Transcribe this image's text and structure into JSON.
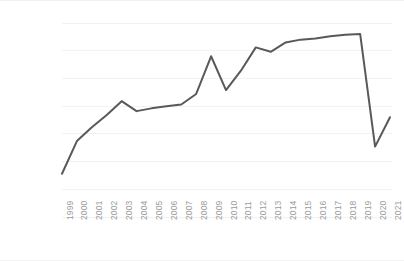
{
  "chart_data": {
    "type": "line",
    "title": "",
    "subtitle": "",
    "xlabel": "",
    "ylabel": "",
    "categories": [
      "1999",
      "2000",
      "2001",
      "2002",
      "2003",
      "2004",
      "2005",
      "2006",
      "2007",
      "2008",
      "2009",
      "2010",
      "2011",
      "2012",
      "2013",
      "2014",
      "2015",
      "2016",
      "2017",
      "2018",
      "2019",
      "2020",
      "2021"
    ],
    "values": [
      780000,
      1370000,
      1620000,
      1840000,
      2090000,
      1910000,
      1960000,
      2000000,
      2030000,
      2220000,
      2900000,
      2290000,
      2640000,
      3060000,
      2980000,
      3150000,
      3200000,
      3220000,
      3260000,
      3290000,
      3300000,
      1270000,
      1800000
    ],
    "series": [
      {
        "name": "series-1",
        "values": [
          780000,
          1370000,
          1620000,
          1840000,
          2090000,
          1910000,
          1960000,
          2000000,
          2030000,
          2220000,
          2900000,
          2290000,
          2640000,
          3060000,
          2980000,
          3150000,
          3200000,
          3220000,
          3260000,
          3290000,
          3300000,
          1270000,
          1800000
        ],
        "color": "#595959"
      }
    ],
    "ylim": [
      0,
      3500000
    ],
    "yticks": [
      0,
      500000,
      1000000,
      1500000,
      2000000,
      2500000,
      3000000,
      3500000
    ],
    "ytick_labels": [
      "0",
      "500,000",
      "1,000,000",
      "1,500,000",
      "2,000,000",
      "2,500,000",
      "3,000,000",
      "3,500,000"
    ],
    "xtick_labels": [
      "1999",
      "2000",
      "2001",
      "2002",
      "2003",
      "2004",
      "2005",
      "2006",
      "2007",
      "2008",
      "2009",
      "2010",
      "2011",
      "2012",
      "2013",
      "2014",
      "2015",
      "2016",
      "2017",
      "2018",
      "2019",
      "2020",
      "2021"
    ],
    "xtick_rotation": -90,
    "grid": "horizontal",
    "gridline_color": "#f2f2f2",
    "legend": "none",
    "markers": "none",
    "line_color": "#595959",
    "line_width": 2,
    "axis_label_color": "#9b9b9b",
    "background_color": "#ffffff"
  },
  "layout": {
    "plot_left": 62,
    "plot_right": 390,
    "plot_top": 22,
    "plot_bottom": 216
  }
}
